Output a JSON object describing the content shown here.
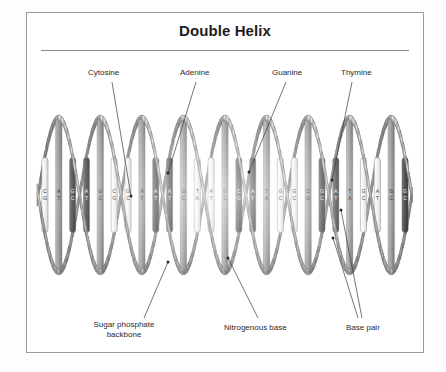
{
  "figure": {
    "title": "Double Helix",
    "background_color": "#fdfdfd",
    "panel_border_color": "#9a9a9a",
    "rule_color": "#8d8d8d",
    "label_color": "#2a2a2a"
  },
  "callouts": {
    "cytosine": "Cytosine",
    "adenine": "Adenine",
    "guanine": "Guanine",
    "thymine": "Thymine",
    "sugar_phosphate_backbone_line1": "Sugar phosphate",
    "sugar_phosphate_backbone_line2": "backbone",
    "nitrogenous_base": "Nitrogenous base",
    "base_pair": "Base pair"
  },
  "diagram_data": {
    "type": "illustration",
    "subject": "DNA double helix",
    "orientation": "horizontal",
    "turns": 4.5,
    "helix_bounds": {
      "x0": 38,
      "x1": 412,
      "y0": 118,
      "y1": 272
    },
    "palette": {
      "ribbon_light": "#e6e6e6",
      "ribbon_mid": "#b4b4b4",
      "ribbon_dark": "#7d7d7d",
      "rung_light": "#f2f2f2",
      "rung_mid": "#a8a8a8",
      "rung_dark": "#4a4a4a",
      "outline": "#6f6f6f"
    },
    "base_letters": [
      "A",
      "T",
      "G",
      "C"
    ],
    "base_pairs": [
      {
        "top": "C",
        "bottom": "G"
      },
      {
        "top": "A",
        "bottom": "T"
      },
      {
        "top": "G",
        "bottom": "C"
      },
      {
        "top": "A",
        "bottom": "T"
      },
      {
        "top": "G",
        "bottom": "C"
      },
      {
        "top": "C",
        "bottom": "G"
      },
      {
        "top": "G",
        "bottom": "C"
      },
      {
        "top": "A",
        "bottom": "T"
      },
      {
        "top": "A",
        "bottom": "T"
      },
      {
        "top": "A",
        "bottom": "T"
      },
      {
        "top": "G",
        "bottom": "C"
      },
      {
        "top": "T",
        "bottom": "A"
      },
      {
        "top": "A",
        "bottom": "T"
      },
      {
        "top": "G",
        "bottom": "C"
      },
      {
        "top": "C",
        "bottom": "G"
      },
      {
        "top": "A",
        "bottom": "T"
      },
      {
        "top": "T",
        "bottom": "A"
      },
      {
        "top": "G",
        "bottom": "C"
      },
      {
        "top": "G",
        "bottom": "C"
      },
      {
        "top": "C",
        "bottom": "G"
      },
      {
        "top": "G",
        "bottom": "C"
      },
      {
        "top": "A",
        "bottom": "T"
      },
      {
        "top": "T",
        "bottom": "A"
      },
      {
        "top": "G",
        "bottom": "C"
      },
      {
        "top": "A",
        "bottom": "T"
      },
      {
        "top": "G",
        "bottom": "C"
      },
      {
        "top": "G",
        "bottom": "C"
      }
    ]
  },
  "callout_positions": {
    "cytosine": {
      "x": 88,
      "y": 68,
      "lx1": 112,
      "ly1": 82,
      "lx2": 131,
      "ly2": 196
    },
    "adenine": {
      "x": 180,
      "y": 68,
      "lx1": 196,
      "ly1": 82,
      "lx2": 168,
      "ly2": 173
    },
    "guanine": {
      "x": 272,
      "y": 68,
      "lx1": 286,
      "ly1": 82,
      "lx2": 249,
      "ly2": 172
    },
    "thymine": {
      "x": 341,
      "y": 68,
      "lx1": 352,
      "ly1": 82,
      "lx2": 332,
      "ly2": 180
    },
    "sugar": {
      "x": 86,
      "y": 320,
      "lx1": 144,
      "ly1": 318,
      "lx2": 168,
      "ly2": 262
    },
    "nitro": {
      "x": 224,
      "y": 323,
      "lx1": 258,
      "ly1": 318,
      "lx2": 228,
      "ly2": 258
    },
    "basepair": {
      "x": 346,
      "y": 323,
      "lx1": 358,
      "ly1": 318,
      "lx2": 333,
      "ly2": 238
    },
    "basepair2": {
      "lx1": 362,
      "ly1": 318,
      "lx2": 341,
      "ly2": 210
    }
  }
}
